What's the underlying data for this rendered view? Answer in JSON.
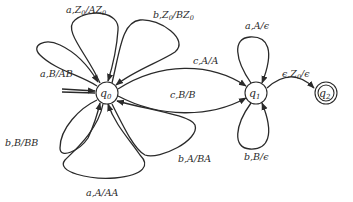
{
  "diagram": {
    "type": "pushdown-automaton",
    "states": [
      {
        "id": "q0",
        "label": "q0",
        "base": "q",
        "sub": "0",
        "initial": true,
        "accepting": false
      },
      {
        "id": "q1",
        "label": "q1",
        "base": "q",
        "sub": "1",
        "initial": false,
        "accepting": false
      },
      {
        "id": "q2",
        "label": "q2",
        "base": "q",
        "sub": "2",
        "initial": false,
        "accepting": true
      }
    ],
    "transitions": [
      {
        "from": "q0",
        "to": "q0",
        "label": "a,Z0/AZ0",
        "parts": [
          "a,Z",
          "0",
          "/AZ",
          "0"
        ]
      },
      {
        "from": "q0",
        "to": "q0",
        "label": "b,Z0/BZ0",
        "parts": [
          "b,Z",
          "0",
          "/BZ",
          "0"
        ]
      },
      {
        "from": "q0",
        "to": "q0",
        "label": "a,B/AB"
      },
      {
        "from": "q0",
        "to": "q0",
        "label": "b,B/BB"
      },
      {
        "from": "q0",
        "to": "q0",
        "label": "a,A/AA"
      },
      {
        "from": "q0",
        "to": "q0",
        "label": "b,A/BA"
      },
      {
        "from": "q0",
        "to": "q1",
        "label": "c,A/A"
      },
      {
        "from": "q0",
        "to": "q1",
        "label": "c,B/B"
      },
      {
        "from": "q1",
        "to": "q1",
        "label": "a,A/ϵ"
      },
      {
        "from": "q1",
        "to": "q1",
        "label": "b,B/ϵ"
      },
      {
        "from": "q1",
        "to": "q2",
        "label": "ϵ,Z0/ϵ",
        "parts": [
          "ϵ,Z",
          "0",
          "/ϵ"
        ]
      }
    ]
  }
}
